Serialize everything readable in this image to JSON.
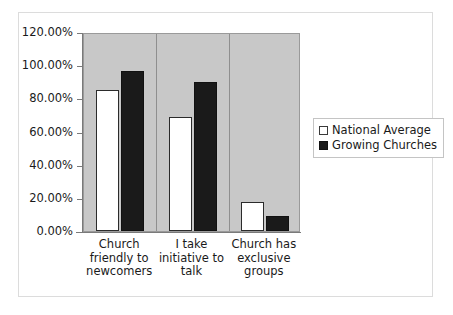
{
  "chart_data": {
    "type": "bar",
    "title": "",
    "subtitle": "",
    "xlabel": "",
    "ylabel": "",
    "ylim": [
      0,
      120
    ],
    "y_tick_labels": [
      "120.00%",
      "100.00%",
      "80.00%",
      "60.00%",
      "40.00%",
      "20.00%",
      "0.00%"
    ],
    "y_tick_values": [
      120,
      100,
      80,
      60,
      40,
      20,
      0
    ],
    "grid": false,
    "legend_position": "right",
    "categories": [
      "Church friendly to newcomers",
      "I take initiative to talk",
      "Church has exclusive groups"
    ],
    "category_label_lines": [
      [
        "Church",
        "friendly to",
        "newcomers"
      ],
      [
        "I take",
        "initiative to",
        "talk"
      ],
      [
        "Church has",
        "exclusive",
        "groups"
      ]
    ],
    "series": [
      {
        "name": "National Average",
        "color": "#ffffff",
        "edge_color": "#2b2b2b",
        "values": [
          85,
          68.5,
          17.5
        ]
      },
      {
        "name": "Growing Churches",
        "color": "#1a1a1a",
        "edge_color": "#111111",
        "values": [
          96.5,
          90,
          9
        ]
      }
    ],
    "plot_background": "#c8c8c8",
    "figure_background": "#ffffff"
  },
  "legend": {
    "items": [
      {
        "label": "National Average",
        "swatch": "national"
      },
      {
        "label": "Growing Churches",
        "swatch": "growing"
      }
    ]
  }
}
